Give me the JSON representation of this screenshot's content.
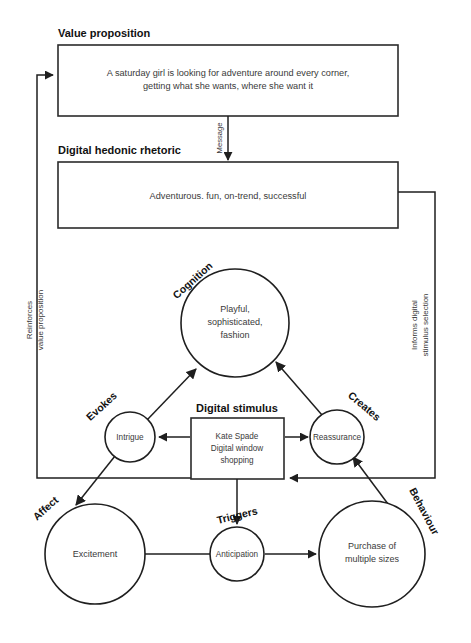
{
  "diagram": {
    "boxes": {
      "value_proposition": {
        "heading": "Value proposition",
        "line1": "A saturday girl is looking for adventure around every corner,",
        "line2": "getting what she wants, where she want it"
      },
      "digital_hedonic_rhetoric": {
        "heading": "Digital hedonic rhetoric",
        "line1": "Adventurous. fun, on-trend, successful"
      },
      "digital_stimulus": {
        "heading": "Digital stimulus",
        "line1": "Kate Spade",
        "line2": "Digital window",
        "line3": "shopping"
      }
    },
    "nodes": {
      "cognition": {
        "line1": "Playful,",
        "line2": "sophisticated,",
        "line3": "fashion"
      },
      "intrigue": {
        "label": "Intrigue"
      },
      "reassurance": {
        "label": "Reassurance"
      },
      "excitement": {
        "label": "Excitement"
      },
      "anticipation": {
        "label": "Anticipation"
      },
      "purchase": {
        "line1": "Purchase of",
        "line2": "multiple sizes"
      }
    },
    "edge_labels": {
      "message": "Message",
      "cognition": "Cognition",
      "evokes": "Evokes",
      "creates": "Creates",
      "affect": "Affect",
      "triggers": "Triggers",
      "behaviour": "Behaviour",
      "reinforces_1": "Reinforces",
      "reinforces_2": "value proposition",
      "informs_1": "Informs digital",
      "informs_2": "stimulus selection"
    },
    "colors": {
      "stroke": "#1f1f1f",
      "box_stroke": "#2b2b2b",
      "text": "#3a3a3a",
      "heading": "#111111",
      "background": "#ffffff"
    }
  }
}
